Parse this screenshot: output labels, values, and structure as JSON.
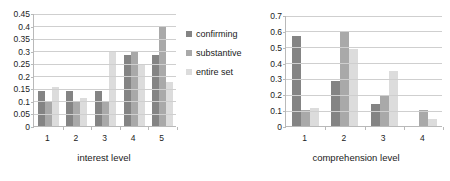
{
  "legend": {
    "position": "center",
    "items": [
      {
        "label": "confirming",
        "color": "#848484"
      },
      {
        "label": "substantive",
        "color": "#a9a9a9"
      },
      {
        "label": "entire set",
        "color": "#dcdcdc"
      }
    ]
  },
  "chart_data": [
    {
      "type": "bar",
      "id": "interest-level-chart",
      "title": "",
      "xlabel": "interest level",
      "ylabel": "",
      "categories": [
        "1",
        "2",
        "3",
        "4",
        "5"
      ],
      "ylim": [
        0,
        0.45
      ],
      "yticks": [
        "0",
        "0.05",
        "0.1",
        "0.15",
        "0.2",
        "0.25",
        "0.3",
        "0.35",
        "0.4",
        "0.45"
      ],
      "ytick_values": [
        0,
        0.05,
        0.1,
        0.15,
        0.2,
        0.25,
        0.3,
        0.35,
        0.4,
        0.45
      ],
      "grid": true,
      "legend": "shared",
      "series": [
        {
          "name": "confirming",
          "color": "#848484",
          "values": [
            0.139,
            0.139,
            0.141,
            0.283,
            0.283
          ]
        },
        {
          "name": "substantive",
          "color": "#a9a9a9",
          "values": [
            0.098,
            0.098,
            0.098,
            0.298,
            0.4
          ]
        },
        {
          "name": "entire set",
          "color": "#dcdcdc",
          "values": [
            0.157,
            0.113,
            0.3,
            0.248,
            0.175
          ]
        }
      ]
    },
    {
      "type": "bar",
      "id": "comprehension-level-chart",
      "title": "",
      "xlabel": "comprehension level",
      "ylabel": "",
      "categories": [
        "1",
        "2",
        "3",
        "4"
      ],
      "ylim": [
        0,
        0.7
      ],
      "yticks": [
        "0",
        "0.1",
        "0.2",
        "0.3",
        "0.4",
        "0.5",
        "0.6",
        "0.7"
      ],
      "ytick_values": [
        0,
        0.1,
        0.2,
        0.3,
        0.4,
        0.5,
        0.6,
        0.7
      ],
      "grid": true,
      "legend": "shared",
      "series": [
        {
          "name": "confirming",
          "color": "#848484",
          "values": [
            0.565,
            0.283,
            0.141,
            0.0
          ]
        },
        {
          "name": "substantive",
          "color": "#a9a9a9",
          "values": [
            0.098,
            0.595,
            0.198,
            0.1
          ]
        },
        {
          "name": "entire set",
          "color": "#dcdcdc",
          "values": [
            0.111,
            0.483,
            0.345,
            0.046
          ]
        }
      ]
    }
  ]
}
